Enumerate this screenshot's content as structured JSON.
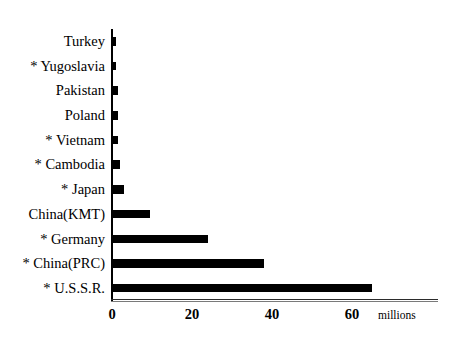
{
  "chart_data": {
    "type": "bar",
    "orientation": "horizontal",
    "title": "",
    "xlabel": "millions",
    "ylabel": "",
    "xlim": [
      0,
      81.5
    ],
    "grid": false,
    "legend": null,
    "unit_label": "millions",
    "xticks": [
      0,
      20,
      40,
      60
    ],
    "xtick_labels": [
      "0",
      "20",
      "40",
      "60"
    ],
    "categories": [
      "Turkey",
      "* Yugoslavia",
      "Pakistan",
      "Poland",
      "* Vietnam",
      "* Cambodia",
      "* Japan",
      "China(KMT)",
      "* Germany",
      "* China(PRC)",
      "* U.S.S.R."
    ],
    "values": [
      1,
      1,
      1.5,
      1.5,
      1.5,
      2,
      3,
      9.5,
      24,
      38,
      65
    ]
  }
}
